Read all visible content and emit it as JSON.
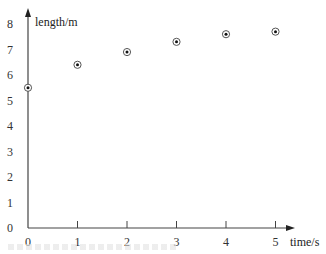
{
  "chart_data": {
    "type": "scatter",
    "title": "",
    "xlabel": "time/s",
    "ylabel": "length/m",
    "x": [
      0,
      1,
      2,
      3,
      4,
      5
    ],
    "series": [
      {
        "name": "length",
        "values": [
          5.5,
          6.4,
          6.9,
          7.3,
          7.6,
          7.7
        ]
      }
    ],
    "xlim": [
      0,
      5
    ],
    "ylim": [
      0,
      8
    ],
    "x_ticks": [
      "0",
      "1",
      "2",
      "3",
      "4",
      "5"
    ],
    "y_ticks": [
      "0",
      "1",
      "2",
      "3",
      "4",
      "5",
      "6",
      "7",
      "8"
    ],
    "grid": false,
    "legend": null,
    "marker": "circled-dot"
  }
}
